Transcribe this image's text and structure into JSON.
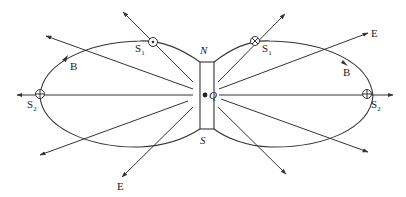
{
  "diagram": {
    "colors": {
      "stroke": "#333333",
      "text": "#222222",
      "background": "#ffffff"
    },
    "bar": {
      "top_label": "N",
      "bottom_label": "S"
    },
    "center_label": "Q",
    "field_labels": {
      "magnetic_left": "B",
      "magnetic_right": "B",
      "electric_top_right": "E",
      "electric_bottom_left": "E"
    },
    "points": {
      "s1_left": {
        "name": "S",
        "sub": "1",
        "symbol": "dot-in-circle"
      },
      "s1_right": {
        "name": "S",
        "sub": "1",
        "symbol": "cross-in-circle"
      },
      "s2_left": {
        "name": "S",
        "sub": "2",
        "symbol": "plus-in-circle"
      },
      "s2_right": {
        "name": "S",
        "sub": "2",
        "symbol": "plus-in-circle"
      }
    }
  }
}
